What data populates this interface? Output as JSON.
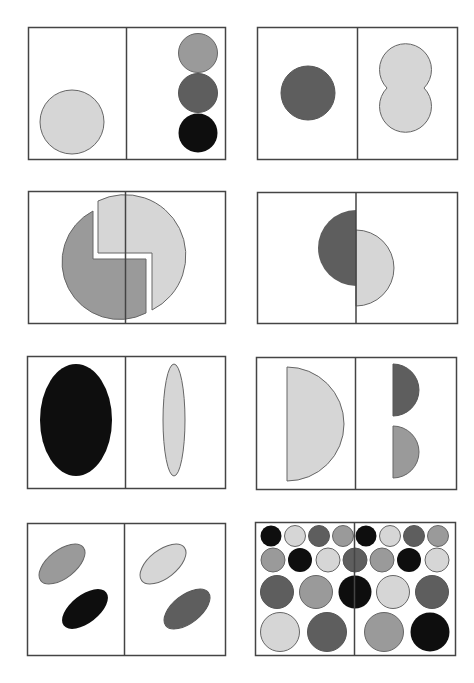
{
  "colors": {
    "light": "#d6d6d6",
    "mid": "#9a9a9a",
    "dark": "#5e5e5e",
    "black": "#0e0e0e",
    "border": "#444444",
    "outline": "#666666"
  },
  "panels": [
    {
      "id": 1,
      "left": "one large light circle at bottom",
      "right": "three stacked circles: mid, dark, black"
    },
    {
      "id": 2,
      "left": "one dark circle",
      "right": "two overlapping light circles (figure eight)"
    },
    {
      "id": 3,
      "left": "mid-gray hooked half of circle",
      "right": "light-gray hooked half of circle"
    },
    {
      "id": 4,
      "left": "dark left semicircle",
      "right": "light right semicircle offset lower"
    },
    {
      "id": 5,
      "left": "black wide ellipse",
      "right": "light thin vertical ellipse"
    },
    {
      "id": 6,
      "left": "large light half-disc",
      "right": "two small half-discs: dark top, mid bottom"
    },
    {
      "id": 7,
      "left": "mid and black tilted ellipses",
      "right": "light and dark tilted ellipses"
    },
    {
      "id": 8,
      "left": "grid of circles in four shades",
      "right": "grid of circles in four shades"
    }
  ]
}
